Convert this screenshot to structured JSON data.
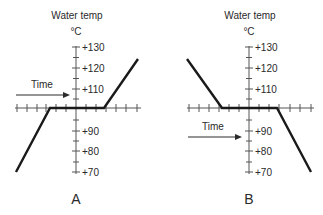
{
  "diagram": {
    "panels": [
      {
        "id": "A",
        "label": "A",
        "axis_title": "Water temp",
        "unit": "°C",
        "ticks": [
          "+130",
          "+120",
          "+110",
          "+90",
          "+80",
          "+70"
        ],
        "arrow_label": "Time",
        "description": "Temperature rises from +70 to +100, plateaus at +100, then rises to about +124"
      },
      {
        "id": "B",
        "label": "B",
        "axis_title": "Water temp",
        "unit": "°C",
        "ticks": [
          "+130",
          "+120",
          "+110",
          "+90",
          "+80",
          "+70"
        ],
        "arrow_label": "Time",
        "description": "Temperature falls from about +124 to +100, plateaus at +100, then falls to +70"
      }
    ],
    "colors": {
      "line": "#1a1a1a",
      "axis": "#555555",
      "text": "#2a2a2a"
    }
  }
}
